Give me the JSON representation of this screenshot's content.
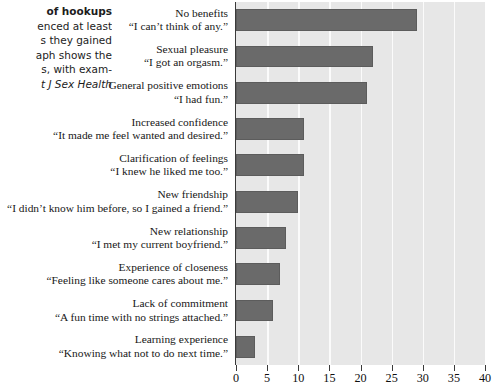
{
  "caption": {
    "lines": [
      {
        "text": "of hookups",
        "style": "bold"
      },
      {
        "text": "enced at least",
        "style": "normal"
      },
      {
        "text": "s they gained",
        "style": "normal"
      },
      {
        "text": "aph shows the",
        "style": "normal"
      },
      {
        "text": "s, with exam-",
        "style": "normal"
      },
      {
        "text": "t J Sex Health",
        "style": "italic"
      }
    ]
  },
  "chart_data": {
    "type": "bar",
    "orientation": "horizontal",
    "title": "",
    "xlabel": "",
    "ylabel": "",
    "xlim": [
      0,
      40
    ],
    "xticks": [
      0,
      5,
      10,
      15,
      20,
      25,
      30,
      35,
      40
    ],
    "grid": "vertical",
    "legend": "none",
    "bar_color": "#6a6a6a",
    "plot_background": "#e7e7e7",
    "gridline_color": "#fbfbfb",
    "categories": [
      "No benefits",
      "Sexual pleasure",
      "General positive emotions",
      "Increased confidence",
      "Clarification of feelings",
      "New friendship",
      "New relationship",
      "Experience of closeness",
      "Lack of commitment",
      "Learning experience"
    ],
    "quotes": [
      "“I can’t think of any.”",
      "“I got an orgasm.”",
      "“I had fun.”",
      "“It made me feel wanted and desired.”",
      "“I knew he liked me too.”",
      "“I didn’t know him before, so I gained a friend.”",
      "“I met my current boyfriend.”",
      "“Feeling like someone cares about me.”",
      "“A fun time with no strings attached.”",
      "“Knowing what not to do next time.”"
    ],
    "values": [
      29,
      22,
      21,
      11,
      11,
      10,
      8,
      7,
      6,
      3
    ]
  }
}
